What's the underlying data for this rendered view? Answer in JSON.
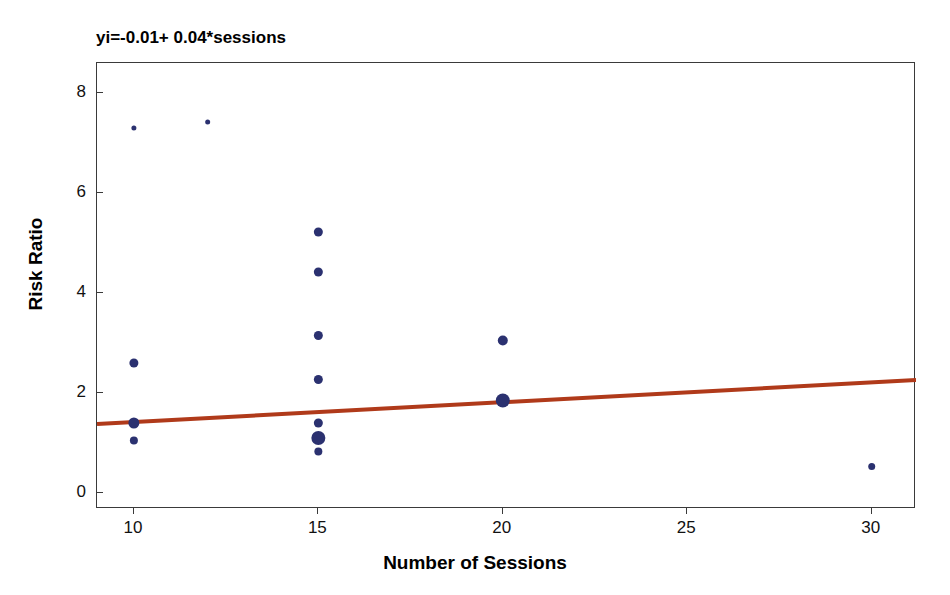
{
  "chart_data": {
    "type": "scatter",
    "title": "yi=-0.01+ 0.04*sessions",
    "xlabel": "Number of Sessions",
    "ylabel": "Risk Ratio",
    "xlim": [
      9.0,
      31.2
    ],
    "ylim": [
      -0.32,
      8.6
    ],
    "grid": false,
    "legend": null,
    "xticks": [
      10,
      15,
      20,
      25,
      30
    ],
    "yticks": [
      0,
      2,
      4,
      6,
      8
    ],
    "xtick_labels": [
      "10",
      "15",
      "20",
      "25",
      "30"
    ],
    "ytick_labels": [
      "0",
      "2",
      "4",
      "6",
      "8"
    ],
    "marker_color": "#2b3170",
    "line_color": "#b03a1a",
    "frame_color": "#3a3a3a",
    "points": [
      {
        "x": 10,
        "y": 7.3,
        "size": 5
      },
      {
        "x": 12,
        "y": 7.42,
        "size": 5
      },
      {
        "x": 10,
        "y": 2.6,
        "size": 9
      },
      {
        "x": 10,
        "y": 1.4,
        "size": 11
      },
      {
        "x": 10,
        "y": 1.05,
        "size": 8
      },
      {
        "x": 15,
        "y": 5.22,
        "size": 9
      },
      {
        "x": 15,
        "y": 4.42,
        "size": 9
      },
      {
        "x": 15,
        "y": 3.15,
        "size": 9
      },
      {
        "x": 15,
        "y": 2.27,
        "size": 9
      },
      {
        "x": 15,
        "y": 1.4,
        "size": 9
      },
      {
        "x": 15,
        "y": 1.1,
        "size": 14
      },
      {
        "x": 15,
        "y": 0.83,
        "size": 8
      },
      {
        "x": 20,
        "y": 3.05,
        "size": 10
      },
      {
        "x": 20,
        "y": 1.85,
        "size": 14
      },
      {
        "x": 30,
        "y": 0.53,
        "size": 7
      }
    ],
    "fit_line": {
      "intercept": -0.01,
      "slope": 0.04,
      "x_start": 9.0,
      "y_start": 1.38,
      "x_end": 31.2,
      "y_end": 2.26,
      "width": 4
    }
  }
}
